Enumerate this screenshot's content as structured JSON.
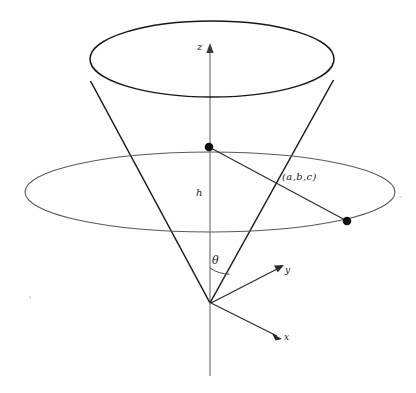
{
  "figure": {
    "type": "geometric-diagram",
    "background_color": "#fefefe",
    "stroke_color": "#1a1a1a",
    "plane_stroke_color": "#555555",
    "labels": {
      "z_axis": "z",
      "y_axis": "y",
      "x_axis": "x",
      "height": "h",
      "angle": "θ",
      "point": "(a,b,c)"
    },
    "geometry": {
      "apex": {
        "x": 210,
        "y": 303
      },
      "axis_top": {
        "x": 210,
        "y": 45
      },
      "axis_bottom": {
        "x": 210,
        "y": 376
      },
      "top_ellipse": {
        "cx": 212,
        "cy": 59,
        "rx": 122,
        "ry": 38
      },
      "plane_ellipse": {
        "cx": 210,
        "cy": 192,
        "rx": 185,
        "ry": 40
      },
      "cone_left_edge": {
        "x1": 90,
        "y1": 80,
        "x2": 210,
        "y2": 303
      },
      "cone_right_edge": {
        "x1": 334,
        "y1": 80,
        "x2": 210,
        "y2": 303
      },
      "axis_point": {
        "x": 209,
        "y": 147,
        "r": 4
      },
      "plane_point": {
        "x": 347,
        "y": 221,
        "r": 4
      },
      "x_arrow_tip": {
        "x": 281,
        "y": 339
      },
      "y_arrow_tip": {
        "x": 283,
        "y": 266
      },
      "theta_arc": {
        "center_x": 210,
        "center_y": 303,
        "radius": 35
      }
    }
  }
}
